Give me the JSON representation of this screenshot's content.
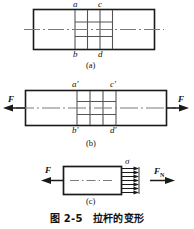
{
  "figure": {
    "caption_number": "图 2-5",
    "caption_title": "拉杆的变形",
    "caption_full": "图 2-5　拉杆的变形"
  },
  "panels": [
    {
      "id": "a",
      "sub_caption": "(a)",
      "description": "undeformed-bar-with-grid",
      "labels": {
        "top_left": "a",
        "top_right": "c",
        "bottom_left": "b",
        "bottom_right": "d"
      }
    },
    {
      "id": "b",
      "sub_caption": "(b)",
      "description": "stretched-bar-under-tension",
      "labels": {
        "top_left": "a′",
        "top_right": "c′",
        "bottom_left": "b′",
        "bottom_right": "d′",
        "force_left": "F",
        "force_right": "F"
      }
    },
    {
      "id": "c",
      "sub_caption": "(c)",
      "description": "free-body-section-with-stress-distribution",
      "labels": {
        "force_left": "F",
        "stress": "σ",
        "internal_force": "F",
        "internal_force_subscript": "N"
      }
    }
  ],
  "colors": {
    "line": "#1a1a1a",
    "centerline": "#7a7a7a",
    "grid": "#555555",
    "background": "#ffffff"
  }
}
